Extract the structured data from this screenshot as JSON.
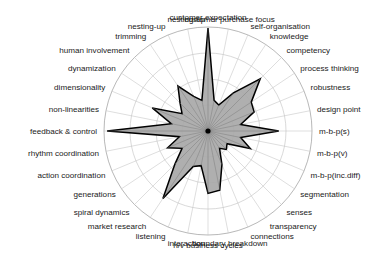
{
  "chart_data": {
    "type": "radar",
    "title": "",
    "subtitle": "",
    "xlabel": "",
    "ylabel": "",
    "grid": true,
    "legend": false,
    "legend_position": "none",
    "rings": 4,
    "rmin": 0,
    "rmax": 100,
    "start_angle_deg": -90,
    "direction": "clockwise",
    "fill_color": "#a8a8a8",
    "line_color": "#000000",
    "grid_color": "#bdbdbd",
    "categories": [
      "customer expectation",
      "customer purchase focus",
      "self-organisation",
      "knowledge",
      "competency",
      "process thinking",
      "robustness",
      "design point",
      "m-b-p(s)",
      "m-b-p(v)",
      "m-b-p(inc.diff)",
      "segmentation",
      "senses",
      "transparency",
      "connections",
      "boundary breakdown",
      "h/v business cycles",
      "interaction",
      "listening",
      "market research",
      "spiral dynamics",
      "generations",
      "action coordination",
      "rhythm coordination",
      "feedback & control",
      "non-linearities",
      "dimensionality",
      "dynamization",
      "human involvement",
      "trimming",
      "nesting-up",
      "customer expectation-top"
    ],
    "axes": [
      {
        "label": "customer expectation",
        "value": 99
      },
      {
        "label": "customer purchase focus",
        "value": 30
      },
      {
        "label": "self-organisation",
        "value": 27
      },
      {
        "label": "knowledge",
        "value": 44
      },
      {
        "label": "competency",
        "value": 71
      },
      {
        "label": "process thinking",
        "value": 50
      },
      {
        "label": "robustness",
        "value": 48
      },
      {
        "label": "design point",
        "value": 32
      },
      {
        "label": "m-b-p(s)",
        "value": 68
      },
      {
        "label": "m-b-p(v)",
        "value": 32
      },
      {
        "label": "m-b-p(inc.diff)",
        "value": 44
      },
      {
        "label": "segmentation",
        "value": 22
      },
      {
        "label": "senses",
        "value": 25
      },
      {
        "label": "transparency",
        "value": 20
      },
      {
        "label": "connections",
        "value": 35
      },
      {
        "label": "boundary breakdown",
        "value": 58
      },
      {
        "label": "h/v business cycles",
        "value": 60
      },
      {
        "label": "interaction",
        "value": 34
      },
      {
        "label": "listening",
        "value": 37
      },
      {
        "label": "market research",
        "value": 78
      },
      {
        "label": "spiral dynamics",
        "value": 45
      },
      {
        "label": "generations",
        "value": 30
      },
      {
        "label": "action coordination",
        "value": 42
      },
      {
        "label": "rhythm coordination",
        "value": 28
      },
      {
        "label": "feedback & control",
        "value": 97
      },
      {
        "label": "non-linearities",
        "value": 36
      },
      {
        "label": "dimensionality",
        "value": 58
      },
      {
        "label": "dynamization",
        "value": 30
      },
      {
        "label": "human involvement",
        "value": 38
      },
      {
        "label": "trimming",
        "value": 52
      },
      {
        "label": "nesting-up",
        "value": 36
      },
      {
        "label": "nesting-up-2",
        "value": 30
      }
    ]
  },
  "geometry": {
    "cx": 208,
    "cy": 131,
    "r": 104,
    "label_offset": 7
  }
}
